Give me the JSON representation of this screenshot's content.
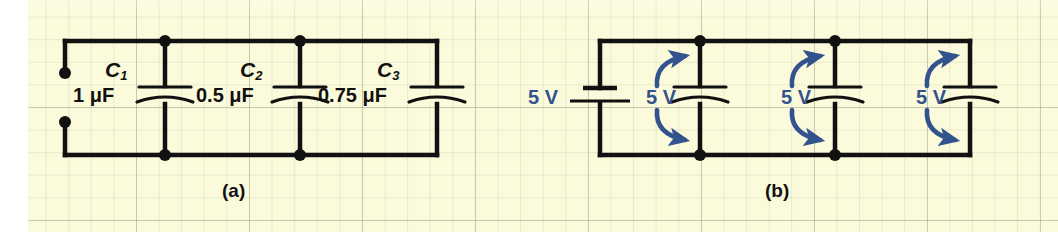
{
  "figure": {
    "type": "circuit-diagram",
    "background_color": "#fbfbdc",
    "wire_color": "#111111",
    "annotation_color": "#33538f"
  },
  "panel_a": {
    "label": "(a)",
    "terminals": 2,
    "capacitors": [
      {
        "name": "C",
        "subscript": "1",
        "value": "1 μF"
      },
      {
        "name": "C",
        "subscript": "2",
        "value": "0.5 μF"
      },
      {
        "name": "C",
        "subscript": "3",
        "value": "0.75 μF"
      }
    ]
  },
  "panel_b": {
    "label": "(b)",
    "source": {
      "value": "5 V",
      "type": "battery"
    },
    "capacitor_voltages": [
      {
        "value": "5 V"
      },
      {
        "value": "5 V"
      },
      {
        "value": "5 V"
      }
    ]
  }
}
